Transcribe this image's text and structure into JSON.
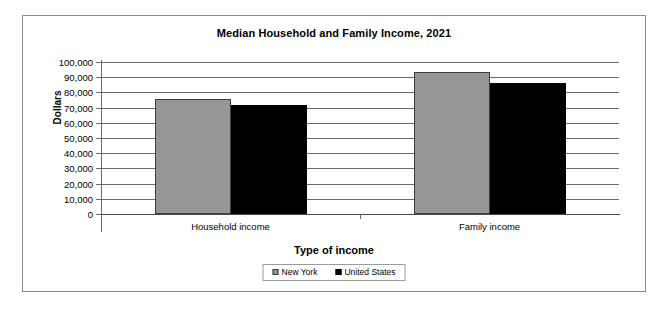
{
  "chart_data": {
    "type": "bar",
    "title": "Median Household and Family Income, 2021",
    "xlabel": "Type of income",
    "ylabel": "Dollars",
    "categories": [
      "Household income",
      "Family income"
    ],
    "series": [
      {
        "name": "New York",
        "color": "#969696",
        "values": [
          75600,
          93400
        ]
      },
      {
        "name": "United States",
        "color": "#000000",
        "values": [
          71700,
          86200
        ]
      }
    ],
    "ylim": [
      0,
      100000
    ],
    "ytick_labels": [
      "100,000",
      "90,000",
      "80,000",
      "70,000",
      "60,000",
      "50,000",
      "40,000",
      "30,000",
      "20,000",
      "10,000",
      "0"
    ],
    "ytick_values": [
      100000,
      90000,
      80000,
      70000,
      60000,
      50000,
      40000,
      30000,
      20000,
      10000,
      0
    ],
    "grid": true,
    "legend_position": "bottom"
  },
  "legend": {
    "entries": [
      {
        "label": "New York",
        "swatch": "gray-square-icon"
      },
      {
        "label": "United States",
        "swatch": "black-square-icon"
      }
    ]
  }
}
